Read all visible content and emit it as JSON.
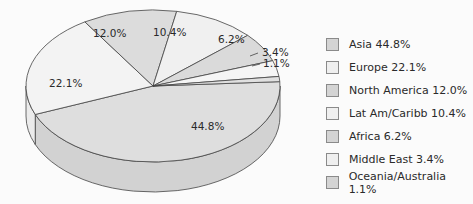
{
  "chart_data": {
    "type": "pie",
    "style": "3d",
    "title": "",
    "categories": [
      "Asia",
      "Europe",
      "North America",
      "Lat Am/Caribb",
      "Africa",
      "Middle East",
      "Oceania/Australia"
    ],
    "values": [
      44.8,
      22.1,
      12.0,
      10.4,
      6.2,
      3.4,
      1.1
    ],
    "slice_labels": [
      "44.8%",
      "22.1%",
      "12.0%",
      "10.4%",
      "6.2%",
      "3.4%",
      "1.1%"
    ],
    "colors": [
      "#dedede",
      "#f3f3f3",
      "#dcdcdc",
      "#f0f0f0",
      "#dadada",
      "#f5f5f5",
      "#e0e0e0"
    ],
    "legend_position": "right"
  },
  "legend": [
    {
      "label": "Asia 44.8%",
      "color": "#d4d4d4"
    },
    {
      "label": "Europe 22.1%",
      "color": "#efefef"
    },
    {
      "label": "North America 12.0%",
      "color": "#d4d4d4"
    },
    {
      "label": "Lat Am/Caribb 10.4%",
      "color": "#efefef"
    },
    {
      "label": "Africa 6.2%",
      "color": "#d4d4d4"
    },
    {
      "label": "Middle East 3.4%",
      "color": "#efefef"
    },
    {
      "label": "Oceania/Australia 1.1%",
      "color": "#d4d4d4"
    }
  ]
}
